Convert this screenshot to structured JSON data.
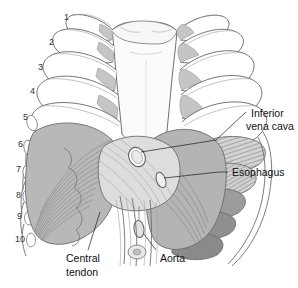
{
  "figure": {
    "background_color": "#ffffff"
  },
  "labels": [
    {
      "id": "inferior-vena-cava",
      "line1": "Inferior",
      "line2": "vena cava",
      "x": 251,
      "y": 117
    },
    {
      "id": "esophagus",
      "line1": "Esophagus",
      "line2": "",
      "x": 232,
      "y": 173
    },
    {
      "id": "aorta",
      "line1": "Aorta",
      "line2": "",
      "x": 160,
      "y": 259
    },
    {
      "id": "central-tendon",
      "line1": "Central",
      "line2": "tendon",
      "x": 66,
      "y": 262
    }
  ],
  "rib_numbers": [
    {
      "n": "1",
      "x": 64,
      "y": 20
    },
    {
      "n": "2",
      "x": 49,
      "y": 45
    },
    {
      "n": "3",
      "x": 38,
      "y": 70
    },
    {
      "n": "4",
      "x": 30,
      "y": 94
    },
    {
      "n": "5",
      "x": 23,
      "y": 120
    },
    {
      "n": "6",
      "x": 18,
      "y": 147
    },
    {
      "n": "7",
      "x": 16,
      "y": 172
    },
    {
      "n": "8",
      "x": 16,
      "y": 198
    },
    {
      "n": "9",
      "x": 17,
      "y": 219
    },
    {
      "n": "10",
      "x": 18,
      "y": 242
    }
  ],
  "colors": {
    "bone_fill": "#ffffff",
    "bone_stroke": "#6e6e6e",
    "cartilage_gray": "#c8c8c8",
    "rib_shadow_gray": "#9a9a9a",
    "diaphragm_gray": "#b9b9b9",
    "tendon_light": "#dcdcdc",
    "hatch_gray": "#8d8d8d",
    "label_text": "#111111",
    "leader_line": "#1a1a1a"
  },
  "structures": [
    "sternum",
    "manubrium",
    "costal cartilage",
    "ribs 1-10",
    "diaphragm",
    "central tendon",
    "caval opening",
    "esophageal hiatus",
    "aortic hiatus",
    "crus of diaphragm"
  ]
}
